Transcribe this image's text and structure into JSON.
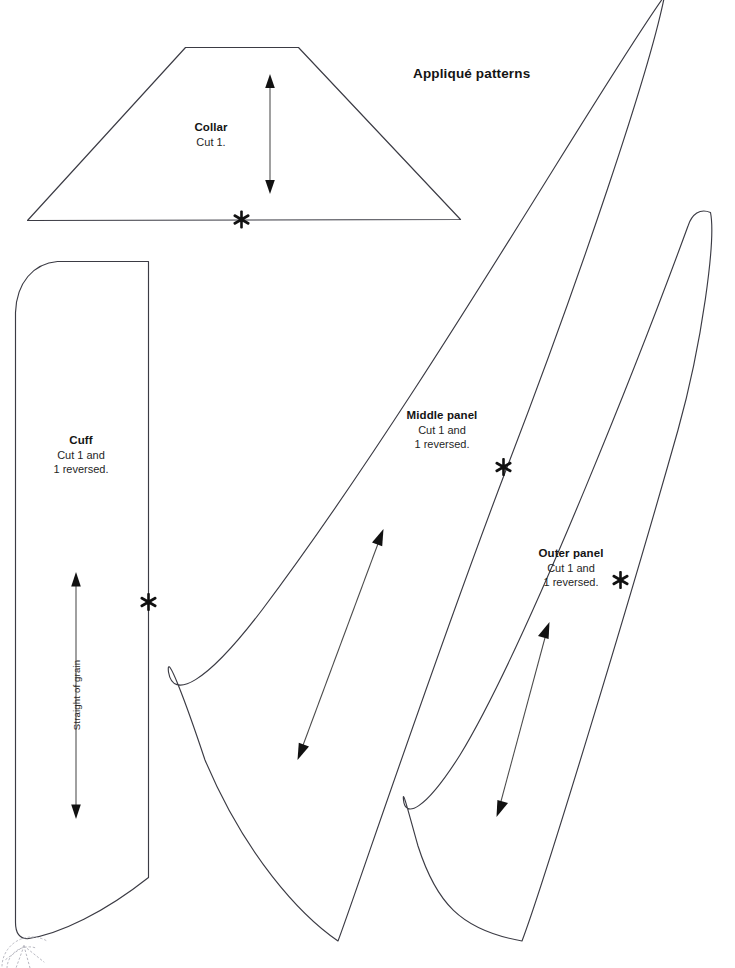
{
  "page": {
    "title": "Appliqué patterns",
    "background_color": "#ffffff",
    "line_color": "#3b3b44",
    "text_color": "#141414",
    "width": 735,
    "height": 968
  },
  "pieces": {
    "collar": {
      "name": "Collar",
      "cut_instruction": "Cut 1.",
      "shape": "trapezoid",
      "grainline": "vertical double-headed arrow",
      "notch_marker": "asterisk"
    },
    "cuff": {
      "name": "Cuff",
      "cut_instruction_line1": "Cut 1 and",
      "cut_instruction_line2": "1 reversed.",
      "grainline_label": "Straight of grain",
      "shape": "long rounded rectangle with curved hem",
      "notch_marker": "asterisk"
    },
    "middle_panel": {
      "name": "Middle panel",
      "cut_instruction_line1": "Cut 1 and",
      "cut_instruction_line2": "1 reversed.",
      "shape": "long tapered gore",
      "grainline": "diagonal double-headed arrow",
      "notch_marker": "asterisk"
    },
    "outer_panel": {
      "name": "Outer panel",
      "cut_instruction_line1": "Cut 1 and",
      "cut_instruction_line2": "1 reversed.",
      "shape": "long narrow tapered gore",
      "grainline": "diagonal double-headed arrow",
      "notch_marker": "asterisk"
    }
  },
  "markers": {
    "asterisk_glyph": "six-pointed star notch",
    "count": 4
  }
}
